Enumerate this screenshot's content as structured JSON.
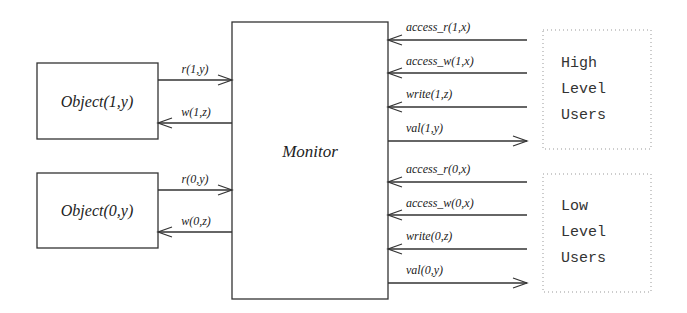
{
  "diagram": {
    "title": "",
    "monitor": {
      "label": "Monitor"
    },
    "objects": [
      {
        "label": "Object(1,y)",
        "read_label": "r(1,y)",
        "write_label": "w(1,z)"
      },
      {
        "label": "Object(0,y)",
        "read_label": "r(0,y)",
        "write_label": "w(0,z)"
      }
    ],
    "user_groups": [
      {
        "lines": [
          "High",
          "Level",
          "Users"
        ],
        "signals": [
          {
            "label": "access_r(1,x)",
            "direction": "to-monitor"
          },
          {
            "label": "access_w(1,x)",
            "direction": "to-monitor"
          },
          {
            "label": "write(1,z)",
            "direction": "to-monitor"
          },
          {
            "label": "val(1,y)",
            "direction": "to-users"
          }
        ]
      },
      {
        "lines": [
          "Low",
          "Level",
          "Users"
        ],
        "signals": [
          {
            "label": "access_r(0,x)",
            "direction": "to-monitor"
          },
          {
            "label": "access_w(0,x)",
            "direction": "to-monitor"
          },
          {
            "label": "write(0,z)",
            "direction": "to-monitor"
          },
          {
            "label": "val(0,y)",
            "direction": "to-users"
          }
        ]
      }
    ],
    "colors": {
      "stroke": "#333333",
      "dotted_border": "#999999",
      "background": "#ffffff"
    }
  }
}
